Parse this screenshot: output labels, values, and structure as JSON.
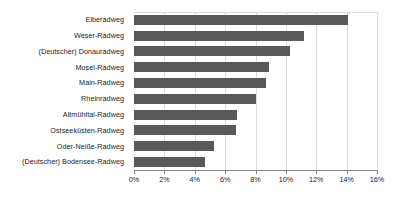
{
  "chart_data": {
    "type": "bar",
    "orientation": "horizontal",
    "title": "",
    "subtitle": "",
    "xlabel": "",
    "ylabel": "",
    "xlim": [
      0,
      16
    ],
    "xtick_labels": [
      "0%",
      "2%",
      "4%",
      "6%",
      "8%",
      "10%",
      "12%",
      "14%",
      "16%"
    ],
    "xticks": [
      0,
      2,
      4,
      6,
      8,
      10,
      12,
      14,
      16
    ],
    "grid": "vertical",
    "legend": "none",
    "unit": "%",
    "bar_color": "#595959",
    "gridline_color": "#d9d9d9",
    "axis_color": "#868686",
    "text_color": "#1a1a1a",
    "categories": [
      "Elberadweg",
      "Weser-Radweg",
      "(Deutscher) Donauradweg",
      "Mosel-Radweg",
      "Main-Radweg",
      "Rheinradweg",
      "Altmühltal-Radweg",
      "Ostseeküsten-Radweg",
      "Oder-Neiße-Radweg",
      "(Deutscher) Bodensee-Radweg"
    ],
    "values": [
      14.1,
      11.2,
      10.3,
      8.9,
      8.7,
      8.0,
      6.8,
      6.7,
      5.3,
      4.7
    ]
  }
}
